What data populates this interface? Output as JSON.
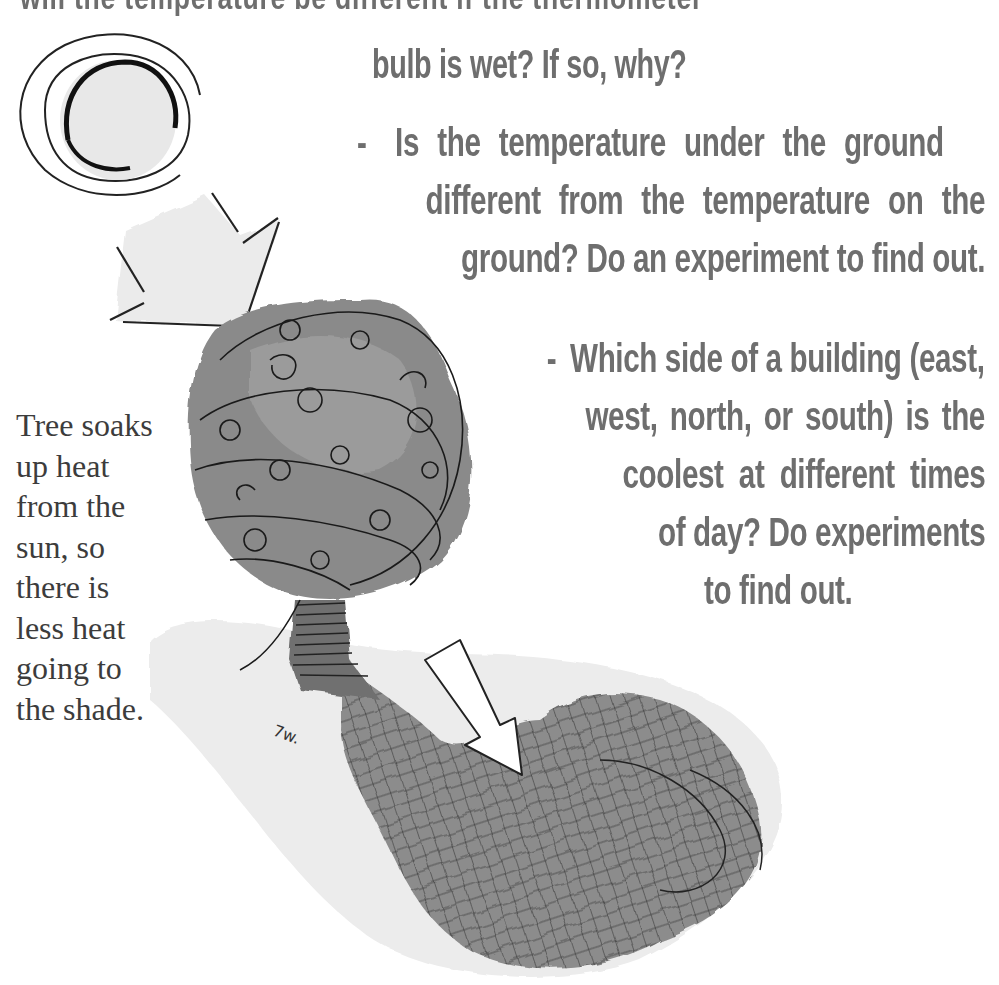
{
  "document": {
    "partial_top_line": "will the temperature be different if the thermometer",
    "questions": [
      {
        "id": "wet-bulb",
        "lines": [
          "bulb is wet? If so, why?"
        ]
      },
      {
        "id": "underground",
        "bullet": "-",
        "lines": [
          "Is the temperature under the ground",
          "different from the temperature on the",
          "ground? Do an experiment to find out."
        ]
      },
      {
        "id": "building-side",
        "bullet": "-",
        "lines": [
          "Which side of a building (east,",
          "west, north, or south) is the",
          "coolest at different times",
          "of day? Do experiments",
          "to find out."
        ]
      }
    ],
    "caption": {
      "lines": [
        "Tree soaks",
        "up heat",
        "from the",
        "sun, so",
        "there is",
        "less heat",
        "going to",
        "the shade."
      ]
    },
    "illustration": {
      "elements": [
        "sun-icon",
        "heat-arrow-from-sun",
        "tree",
        "shade-arrow",
        "tree-shadow"
      ]
    },
    "colors": {
      "question_text": "#6e6e6e",
      "caption_text": "#3c3c3c",
      "ink": "#1a1a1a",
      "wash_light": "#e6e6e6",
      "wash_mid": "#9a9a9a",
      "wash_dark": "#7d7d7d"
    }
  }
}
